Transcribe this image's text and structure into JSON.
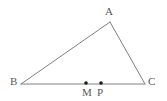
{
  "figure": {
    "type": "geometry-diagram",
    "background_color": "#ffffff",
    "line_color": "#808080",
    "label_color": "#5a5a5a",
    "point_color": "#1a1a1a",
    "canvas": {
      "width": 167,
      "height": 101
    },
    "vertices": [
      {
        "id": "A",
        "label": "A",
        "x": 110,
        "y": 22,
        "label_x": 105,
        "label_y": 6
      },
      {
        "id": "B",
        "label": "B",
        "x": 21,
        "y": 84,
        "label_x": 10,
        "label_y": 76
      },
      {
        "id": "C",
        "label": "C",
        "x": 145,
        "y": 84,
        "label_x": 148,
        "label_y": 76
      }
    ],
    "edges": [
      {
        "id": "AB",
        "from": "B",
        "to": "A"
      },
      {
        "id": "AC",
        "from": "A",
        "to": "C"
      },
      {
        "id": "BC",
        "from": "B",
        "to": "C"
      }
    ],
    "marked_points": [
      {
        "id": "M",
        "label": "M",
        "x": 86,
        "y": 83,
        "on_segment": "BC",
        "label_x": 82,
        "label_y": 87
      },
      {
        "id": "P",
        "label": "P",
        "x": 101,
        "y": 83,
        "on_segment": "BC",
        "label_x": 97,
        "label_y": 87
      }
    ]
  }
}
